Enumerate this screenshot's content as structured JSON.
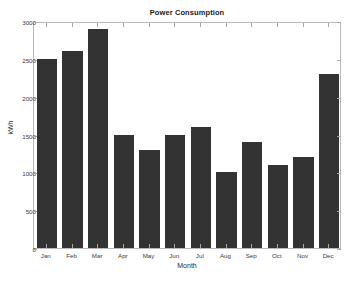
{
  "chart_data": {
    "type": "bar",
    "title": "Power Consumption",
    "xlabel": "Month",
    "ylabel": "kWh",
    "categories": [
      "Jan",
      "Feb",
      "Mar",
      "Apr",
      "May",
      "Jun",
      "Jul",
      "Aug",
      "Sep",
      "Oct",
      "Nov",
      "Dec"
    ],
    "values": [
      2500,
      2600,
      2900,
      1500,
      1300,
      1500,
      1600,
      1000,
      1400,
      1100,
      1200,
      2300
    ],
    "ylim": [
      0,
      3000
    ],
    "yticks": [
      0,
      500,
      1000,
      1500,
      2000,
      2500,
      3000
    ],
    "ytick_labels": [
      "0",
      "500",
      "1000",
      "1500",
      "2000",
      "2500",
      "3000"
    ],
    "grid": false,
    "legend": null,
    "bar_color": "#333333",
    "axes_color": "#b9b9b9",
    "background_color": "#ffffff"
  }
}
